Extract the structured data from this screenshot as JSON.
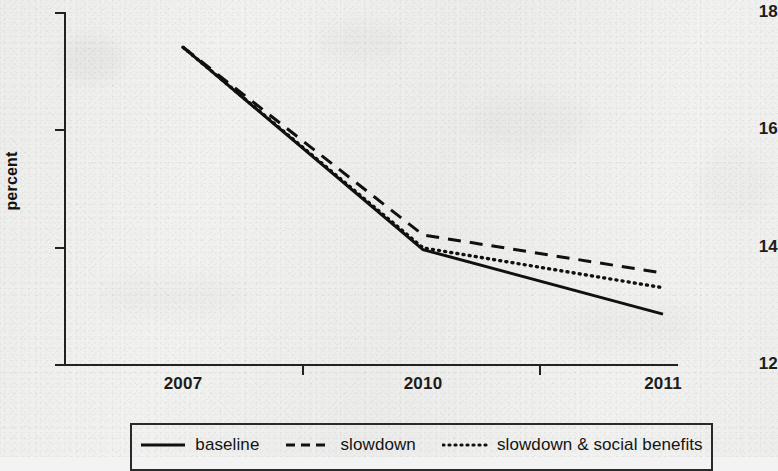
{
  "chart_data": {
    "type": "line",
    "title": "",
    "subtitle": "",
    "xlabel": "",
    "ylabel": "percent",
    "categories": [
      "2007",
      "2010",
      "2011"
    ],
    "x": [
      2007,
      2010,
      2011
    ],
    "xlim": [
      2007,
      2011
    ],
    "ylim": [
      12,
      18
    ],
    "yticks": [
      "12",
      "14",
      "16",
      "18"
    ],
    "ytick_values": [
      12,
      14,
      16,
      18
    ],
    "xticks": [
      "2007",
      "2010",
      "2011"
    ],
    "grid": false,
    "legend_position": "bottom",
    "series": [
      {
        "name": "baseline",
        "style": "solid",
        "color": "#111111",
        "values": [
          17.4,
          13.95,
          12.85
        ]
      },
      {
        "name": "slowdown",
        "style": "dashed",
        "color": "#111111",
        "values": [
          17.4,
          14.2,
          13.55
        ]
      },
      {
        "name": "slowdown & social benefits",
        "style": "dotted",
        "color": "#111111",
        "values": [
          17.4,
          13.98,
          13.3
        ]
      }
    ]
  },
  "axes": {
    "y_title": "percent",
    "y_labels": [
      "18",
      "16",
      "14",
      "12"
    ],
    "x_labels": [
      "2007",
      "2010",
      "2011"
    ]
  },
  "legend": {
    "items": [
      {
        "label": "baseline",
        "style": "solid"
      },
      {
        "label": "slowdown",
        "style": "dashed"
      },
      {
        "label": "slowdown & social benefits",
        "style": "dotted"
      }
    ]
  },
  "colors": {
    "ink": "#111111",
    "axis": "#222222",
    "paper": "#f2f2f1"
  }
}
